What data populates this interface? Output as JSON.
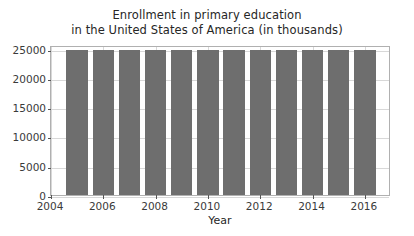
{
  "chart_data": {
    "type": "bar",
    "title": "Enrollment in primary education\nin the United States of America (in thousands)",
    "title_lines": [
      "Enrollment in primary education",
      "in the United States of America (in thousands)"
    ],
    "xlabel": "Year",
    "ylabel": "",
    "categories": [
      2005,
      2006,
      2007,
      2008,
      2009,
      2010,
      2011,
      2012,
      2013,
      2014,
      2015,
      2016
    ],
    "values": [
      24800,
      24800,
      24800,
      24800,
      24800,
      24800,
      24800,
      24800,
      24800,
      24800,
      24800,
      24800
    ],
    "series": [
      {
        "name": "Enrollment in primary education",
        "values": [
          24800,
          24800,
          24800,
          24800,
          24800,
          24800,
          24800,
          24800,
          24800,
          24800,
          24800,
          24800
        ]
      }
    ],
    "ylim": [
      0,
      25600
    ],
    "xlim": [
      2004,
      2017
    ],
    "yticks": [
      0,
      5000,
      10000,
      15000,
      20000,
      25000
    ],
    "ytick_labels": [
      "0",
      "5000",
      "10000",
      "15000",
      "20000",
      "25000"
    ],
    "xticks": [
      2004,
      2006,
      2008,
      2010,
      2012,
      2014,
      2016
    ],
    "xtick_labels": [
      "2004",
      "2006",
      "2008",
      "2010",
      "2012",
      "2014",
      "2016"
    ],
    "grid": true,
    "legend": false,
    "bar_color": "#6e6e6e",
    "grid_color": "#d8d8d8",
    "axes_color": "#b0b0b0",
    "background_color": "#ffffff"
  }
}
